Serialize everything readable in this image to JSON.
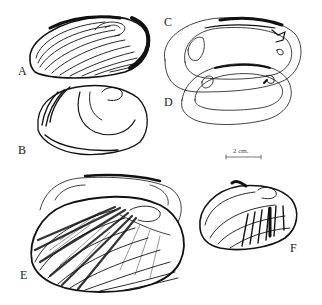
{
  "figure": {
    "panels": [
      {
        "label": "A",
        "description": "shell exterior, concentric growth lines"
      },
      {
        "label": "B",
        "description": "shell exterior, sparse growth lines"
      },
      {
        "label": "C",
        "description": "shell interior outline with muscle scars"
      },
      {
        "label": "D",
        "description": "shell interior outline with muscle scars"
      },
      {
        "label": "E",
        "description": "shell exterior with radial rays, interior outline behind"
      },
      {
        "label": "F",
        "description": "small shell exterior with radial rays"
      }
    ],
    "scale_bar": {
      "label": "2 cm."
    },
    "colors": {
      "ink": "#111111",
      "background": "#ffffff"
    }
  }
}
